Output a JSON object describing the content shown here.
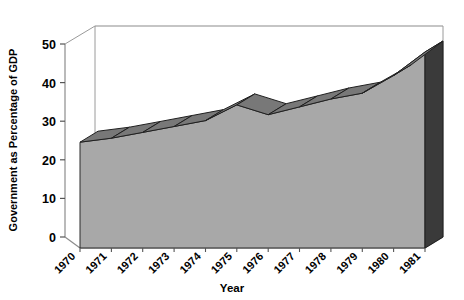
{
  "chart_data": {
    "type": "area",
    "title": "",
    "xlabel": "Year",
    "ylabel": "Government as Percentage of GDP",
    "categories": [
      "1970",
      "1971",
      "1972",
      "1973",
      "1974",
      "1975",
      "1976",
      "1977",
      "1978",
      "1979",
      "1980",
      "1981"
    ],
    "values": [
      27,
      28,
      29.5,
      31,
      32.5,
      36.5,
      34,
      36,
      38,
      39.5,
      44,
      50
    ],
    "ylim": [
      0,
      50
    ],
    "yticks": [
      0,
      10,
      20,
      30,
      40,
      50
    ],
    "ytick_labels": [
      "0",
      "10",
      "20",
      "30",
      "40",
      "50"
    ],
    "grid": false,
    "legend": "none",
    "projection": "3d-ribbon",
    "colors": {
      "front_face": "#a8a8a8",
      "top_ribbon": "#787878",
      "side_face": "#3a3a3a",
      "floor": "#f2f2f2",
      "axis_line": "#8c8c8c",
      "outline": "#1a1a1a",
      "background": "#ffffff"
    }
  },
  "axes": {
    "y_axis_title": "Government as Percentage of GDP",
    "x_axis_title": "Year",
    "y_tick_0": "0",
    "y_tick_1": "10",
    "y_tick_2": "20",
    "y_tick_3": "30",
    "y_tick_4": "40",
    "y_tick_5": "50",
    "x_tick_0": "1970",
    "x_tick_1": "1971",
    "x_tick_2": "1972",
    "x_tick_3": "1973",
    "x_tick_4": "1974",
    "x_tick_5": "1975",
    "x_tick_6": "1976",
    "x_tick_7": "1977",
    "x_tick_8": "1978",
    "x_tick_9": "1979",
    "x_tick_10": "1980",
    "x_tick_11": "1981"
  }
}
